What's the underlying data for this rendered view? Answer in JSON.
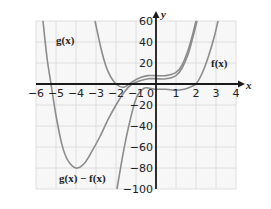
{
  "chart_data": {
    "type": "line",
    "title": "",
    "xlabel": "x",
    "ylabel": "y",
    "xlim": [
      -6,
      4
    ],
    "ylim": [
      -100,
      60
    ],
    "grid": true,
    "x_ticks": [
      -6,
      -5,
      -4,
      -3,
      -2,
      -1,
      0,
      1,
      2,
      3,
      4
    ],
    "x_tick_labels": [
      "-6",
      "-5",
      "-4",
      "-3",
      "-2",
      "-1",
      "0",
      "1",
      "2",
      "3",
      "4"
    ],
    "y_ticks": [
      60,
      40,
      20,
      -20,
      -40,
      -60,
      -80,
      -100
    ],
    "y_tick_labels": [
      "60",
      "40",
      "20",
      "-20",
      "-40",
      "-60",
      "-80",
      "-100"
    ],
    "series": [
      {
        "name": "g(x)",
        "label_pos": [
          -5.0,
          38
        ],
        "points": [
          [
            -3.05,
            60
          ],
          [
            -2.7,
            30
          ],
          [
            -2.4,
            12
          ],
          [
            -2.0,
            0
          ],
          [
            -1.6,
            -3
          ],
          [
            -1.2,
            2
          ],
          [
            -0.8,
            6
          ],
          [
            -0.4,
            8
          ],
          [
            0,
            8
          ],
          [
            0.5,
            8
          ],
          [
            1.0,
            11
          ],
          [
            1.3,
            18
          ],
          [
            1.6,
            32
          ],
          [
            1.8,
            45
          ],
          [
            2.0,
            60
          ]
        ]
      },
      {
        "name": "g(x) − f(x)",
        "label_pos": [
          -4.85,
          -93
        ],
        "points": [
          [
            -5.65,
            60
          ],
          [
            -5.45,
            25
          ],
          [
            -5.25,
            0
          ],
          [
            -5.0,
            -30
          ],
          [
            -4.7,
            -58
          ],
          [
            -4.4,
            -73
          ],
          [
            -4.0,
            -80
          ],
          [
            -3.6,
            -76
          ],
          [
            -3.2,
            -64
          ],
          [
            -2.8,
            -50
          ],
          [
            -2.4,
            -34
          ],
          [
            -2.0,
            -20
          ],
          [
            -1.6,
            -8
          ],
          [
            -1.2,
            0
          ],
          [
            -0.8,
            3
          ],
          [
            -0.4,
            5
          ],
          [
            0,
            5
          ],
          [
            0.5,
            5
          ],
          [
            1.0,
            8
          ],
          [
            1.3,
            15
          ],
          [
            1.6,
            28
          ],
          [
            1.85,
            45
          ],
          [
            2.05,
            60
          ]
        ]
      },
      {
        "name": "f(x)",
        "label_pos": [
          2.75,
          16
        ],
        "points": [
          [
            -1.95,
            -100
          ],
          [
            -1.7,
            -72
          ],
          [
            -1.5,
            -52
          ],
          [
            -1.3,
            -35
          ],
          [
            -1.1,
            -20
          ],
          [
            -0.9,
            -10
          ],
          [
            -0.6,
            -4
          ],
          [
            -0.3,
            -4
          ],
          [
            0,
            -5
          ],
          [
            0.5,
            -5
          ],
          [
            1.0,
            -6
          ],
          [
            1.4,
            -5
          ],
          [
            1.7,
            -3
          ],
          [
            2.0,
            0
          ],
          [
            2.3,
            10
          ],
          [
            2.6,
            25
          ],
          [
            2.9,
            44
          ],
          [
            3.1,
            60
          ]
        ]
      }
    ]
  },
  "labels": {
    "x_axis": "x",
    "y_axis": "y",
    "g": "g(x)",
    "gmf": "g(x) − f(x)",
    "f": "f(x)"
  },
  "colors": {
    "curve": "#8c8c8c",
    "axis": "#1a1a1a",
    "grid": "#d8d8d8",
    "plot_bg": "#f7f7f7"
  }
}
